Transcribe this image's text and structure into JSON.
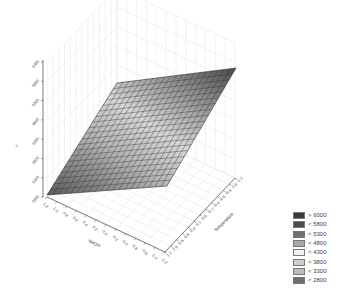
{
  "chart_data": {
    "type": "surface3d",
    "title": "",
    "xlabel": "NaOH",
    "ylabel": "Temperature",
    "zlabel": "Y",
    "x_ticks": [
      "1.2",
      "1.0",
      "0.8",
      "0.6",
      "0.4",
      "0.2",
      "0.0",
      "-0.2",
      "-0.4",
      "-0.6",
      "-0.8",
      "-1.0",
      "-1.2"
    ],
    "y_ticks": [
      "1.2",
      "1.0",
      "0.8",
      "0.6",
      "0.4",
      "0.2",
      "0.0",
      "-0.2",
      "-0.4",
      "-0.6",
      "-0.8",
      "-1.0",
      "-1.2"
    ],
    "z_ticks": [
      "2800",
      "3300",
      "3800",
      "4300",
      "4800",
      "5300",
      "5800",
      "6300"
    ],
    "xlim": [
      -1.2,
      1.2
    ],
    "ylim": [
      -1.2,
      1.2
    ],
    "zlim": [
      2800,
      6300
    ],
    "grid": true,
    "surface": {
      "shape": "plane",
      "corners": [
        {
          "x": 1.2,
          "y": 1.2,
          "z": 2800
        },
        {
          "x": -1.2,
          "y": 1.2,
          "z": 4800
        },
        {
          "x": 1.2,
          "y": -1.2,
          "z": 5600
        },
        {
          "x": -1.2,
          "y": -1.2,
          "z": 6200
        }
      ],
      "grid_divisions": 20
    },
    "legend": {
      "position": "bottom-right",
      "entries": [
        {
          "label": "> 6000",
          "color": "#3a3a3a"
        },
        {
          "label": "< 5800",
          "color": "#4c4c4c"
        },
        {
          "label": "< 5300",
          "color": "#707070"
        },
        {
          "label": "< 4800",
          "color": "#a8a8a8"
        },
        {
          "label": "< 4300",
          "color": "#f2f2f2"
        },
        {
          "label": "< 3800",
          "color": "#cfcfcf"
        },
        {
          "label": "< 3300",
          "color": "#bdbdbd"
        },
        {
          "label": "< 2800",
          "color": "#6e6e6e"
        }
      ]
    }
  }
}
